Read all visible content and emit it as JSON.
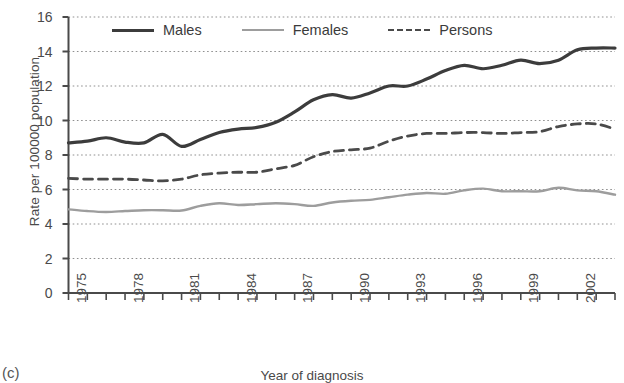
{
  "panel": {
    "label": "(c)"
  },
  "chart_data": {
    "type": "line",
    "title": "",
    "xlabel": "Year of diagnosis",
    "ylabel": "Rate per 100000 population",
    "ylim": [
      0,
      16
    ],
    "xlim": [
      1975,
      2004
    ],
    "ytick_labels": [
      "0",
      "2",
      "4",
      "6",
      "8",
      "10",
      "12",
      "14",
      "16"
    ],
    "yticks": [
      0,
      2,
      4,
      6,
      8,
      10,
      12,
      14,
      16
    ],
    "xtick_labels": [
      "1975",
      "1978",
      "1981",
      "1984",
      "1987",
      "1990",
      "1993",
      "1996",
      "1999",
      "2002"
    ],
    "xticks": [
      1975,
      1978,
      1981,
      1984,
      1987,
      1990,
      1993,
      1996,
      1999,
      2002
    ],
    "grid": "horizontal-dotted",
    "legend_position": "top-center-inside",
    "x": [
      1975,
      1976,
      1977,
      1978,
      1979,
      1980,
      1981,
      1982,
      1983,
      1984,
      1985,
      1986,
      1987,
      1988,
      1989,
      1990,
      1991,
      1992,
      1993,
      1994,
      1995,
      1996,
      1997,
      1998,
      1999,
      2000,
      2001,
      2002,
      2003,
      2004
    ],
    "series": [
      {
        "name": "Males",
        "style": "solid",
        "color": "#3c3c3c",
        "width": 3.2,
        "values": [
          8.7,
          8.8,
          9.0,
          8.75,
          8.7,
          9.2,
          8.5,
          8.9,
          9.3,
          9.5,
          9.6,
          9.9,
          10.5,
          11.2,
          11.5,
          11.3,
          11.6,
          12.0,
          12.0,
          12.4,
          12.9,
          13.2,
          13.0,
          13.2,
          13.5,
          13.3,
          13.5,
          14.1,
          14.2,
          14.2
        ]
      },
      {
        "name": "Females",
        "style": "solid",
        "color": "#9d9d9d",
        "width": 2.4,
        "values": [
          4.85,
          4.75,
          4.7,
          4.75,
          4.8,
          4.8,
          4.78,
          5.05,
          5.2,
          5.1,
          5.15,
          5.2,
          5.15,
          5.05,
          5.25,
          5.35,
          5.4,
          5.55,
          5.7,
          5.8,
          5.75,
          5.95,
          6.05,
          5.9,
          5.9,
          5.9,
          6.1,
          5.95,
          5.9,
          5.7
        ]
      },
      {
        "name": "Persons",
        "style": "dashed",
        "color": "#4a4a4a",
        "width": 2.8,
        "values": [
          6.65,
          6.6,
          6.6,
          6.6,
          6.55,
          6.5,
          6.6,
          6.85,
          6.95,
          7.0,
          7.0,
          7.2,
          7.4,
          7.9,
          8.2,
          8.3,
          8.4,
          8.8,
          9.1,
          9.25,
          9.25,
          9.3,
          9.3,
          9.25,
          9.3,
          9.35,
          9.65,
          9.8,
          9.8,
          9.5
        ]
      }
    ],
    "legend": [
      {
        "label": "Males",
        "swatch": "solid-dark-thick"
      },
      {
        "label": "Females",
        "swatch": "solid-gray"
      },
      {
        "label": "Persons",
        "swatch": "dashed-dark"
      }
    ]
  }
}
